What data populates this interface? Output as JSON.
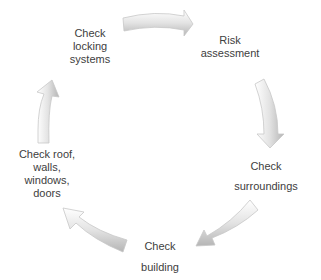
{
  "diagram": {
    "type": "cycle",
    "steps": [
      {
        "id": "risk",
        "lines": [
          "Risk",
          "assessment"
        ]
      },
      {
        "id": "surroundings",
        "lines": [
          "Check",
          "surroundings"
        ]
      },
      {
        "id": "building",
        "lines": [
          "Check",
          "building"
        ]
      },
      {
        "id": "roof",
        "lines": [
          "Check roof,",
          "walls,",
          "windows,",
          "doors"
        ]
      },
      {
        "id": "locking",
        "lines": [
          "Check",
          "locking",
          "systems"
        ]
      }
    ],
    "arrow_color": "#e6e6e6",
    "arrow_shade": "#bdbdbd"
  }
}
